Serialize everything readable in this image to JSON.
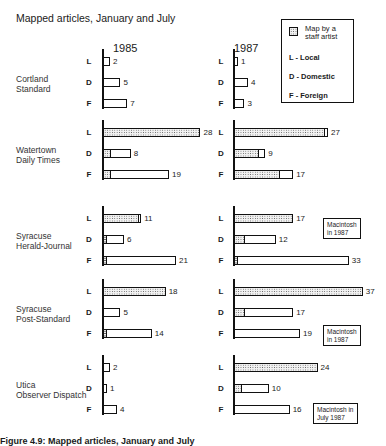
{
  "title": "Mapped articles, January and July",
  "years": [
    "1985",
    "1987"
  ],
  "legend": {
    "swatch_label": "Map by a staff artist",
    "items": [
      "L - Local",
      "D - Domestic",
      "F - Foreign"
    ]
  },
  "row_letters": [
    "L",
    "D",
    "F"
  ],
  "caption": "Figure 4.9: Mapped articles, January and July",
  "colors": {
    "ink": "#111111",
    "shade_fill": "#f1f1f1",
    "shade_dot": "#555555",
    "background": "#ffffff"
  },
  "chart_data": {
    "type": "bar",
    "orientation": "horizontal",
    "title": "Mapped articles, January and July",
    "xlabel": "",
    "ylabel": "",
    "grid": false,
    "legend_position": "top-right",
    "categories": [
      "L",
      "D",
      "F"
    ],
    "category_labels": {
      "L": "Local",
      "D": "Domestic",
      "F": "Foreign"
    },
    "series_note": "Total bar length = mapped articles; dotted portion = maps by a staff artist",
    "papers": [
      {
        "name_lines": [
          "Cortland",
          "Standard"
        ],
        "1985": {
          "total": [
            2,
            5,
            7
          ],
          "staff_artist": [
            0,
            0,
            0
          ]
        },
        "1987": {
          "total": [
            1,
            4,
            3
          ],
          "staff_artist": [
            0,
            0,
            0
          ]
        },
        "note": ""
      },
      {
        "name_lines": [
          "Watertown",
          "Daily Times"
        ],
        "1985": {
          "total": [
            28,
            8,
            19
          ],
          "staff_artist": [
            28,
            2,
            2
          ]
        },
        "1987": {
          "total": [
            27,
            9,
            17
          ],
          "staff_artist": [
            26,
            7,
            13
          ]
        },
        "note": ""
      },
      {
        "name_lines": [
          "Syracuse",
          "Herald-Journal"
        ],
        "1985": {
          "total": [
            11,
            6,
            21
          ],
          "staff_artist": [
            10,
            1,
            1
          ]
        },
        "1987": {
          "total": [
            17,
            12,
            33
          ],
          "staff_artist": [
            17,
            3,
            1
          ]
        },
        "note": "Macintosh in 1987",
        "note_lines": [
          "Macintosh",
          "in 1987"
        ]
      },
      {
        "name_lines": [
          "Syracuse",
          "Post-Standard"
        ],
        "1985": {
          "total": [
            18,
            5,
            14
          ],
          "staff_artist": [
            18,
            0,
            1
          ]
        },
        "1987": {
          "total": [
            37,
            17,
            19
          ],
          "staff_artist": [
            37,
            3,
            0
          ]
        },
        "note": "Macintosh in 1987",
        "note_lines": [
          "Macintosh",
          "in 1987"
        ]
      },
      {
        "name_lines": [
          "Utica",
          "Observer Dispatch"
        ],
        "1985": {
          "total": [
            2,
            1,
            4
          ],
          "staff_artist": [
            0,
            0,
            0
          ]
        },
        "1987": {
          "total": [
            24,
            10,
            16
          ],
          "staff_artist": [
            24,
            2,
            0
          ]
        },
        "note": "Macintosh in July 1987",
        "note_lines": [
          "Macintosh in",
          "July 1987"
        ]
      }
    ]
  }
}
